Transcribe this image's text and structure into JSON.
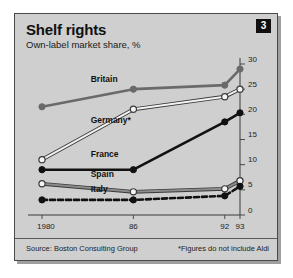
{
  "card": {
    "badge_number": "3",
    "title": "Shelf rights",
    "subtitle": "Own-label market share, %",
    "source": "Source: Boston Consulting Group",
    "footnote": "*Figures do not include Aldi"
  },
  "chart_data": {
    "type": "line",
    "title": "Shelf rights",
    "subtitle": "Own-label market share, %",
    "xlabel": "",
    "ylabel": "Own-label market share, %",
    "x": [
      1980,
      1986,
      1992,
      1993
    ],
    "x_tick_labels": [
      "1980",
      "86",
      "92",
      "93"
    ],
    "y_tick_labels": [
      "0",
      "5",
      "10",
      "15",
      "20",
      "25",
      "30"
    ],
    "y_ticks": [
      0,
      5,
      10,
      15,
      20,
      25,
      30
    ],
    "ylim": [
      0,
      30
    ],
    "y_axis_position": "right",
    "grid": false,
    "legend": "inline-labels",
    "series": [
      {
        "name": "Britain",
        "values": [
          21.5,
          25.0,
          25.8,
          29.0
        ],
        "color": "#6a6a6a",
        "marker": "filled-circle",
        "dash": "solid",
        "label_x": 1983.2,
        "label_y": 26.4
      },
      {
        "name": "Germany*",
        "values": [
          11.0,
          21.0,
          23.5,
          25.0
        ],
        "color": "#f2f2f2",
        "marker": "open-circle",
        "dash": "solid",
        "label_x": 1983.2,
        "label_y": 18.2
      },
      {
        "name": "France",
        "values": [
          9.0,
          9.0,
          18.5,
          20.3
        ],
        "color": "#111111",
        "marker": "filled-circle",
        "dash": "solid",
        "label_x": 1983.2,
        "label_y": 11.6
      },
      {
        "name": "Spain",
        "values": [
          6.2,
          4.6,
          5.2,
          6.8
        ],
        "color": "#8c8c8c",
        "marker": "open-circle",
        "dash": "solid",
        "label_x": 1983.2,
        "label_y": 7.6
      },
      {
        "name": "Italy",
        "values": [
          3.0,
          3.0,
          3.8,
          5.7
        ],
        "color": "#111111",
        "marker": "filled-circle",
        "dash": "dashed",
        "label_x": 1983.2,
        "label_y": 4.6
      }
    ]
  }
}
